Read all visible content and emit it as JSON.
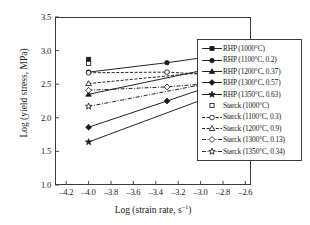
{
  "chart_data": {
    "type": "line",
    "title": "",
    "xlabel": "Log (strain rate, s⁻¹)",
    "ylabel": "Log (yield stress, MPa)",
    "xlim": [
      -4.3,
      -2.55
    ],
    "ylim": [
      1.0,
      3.5
    ],
    "xticks": [
      -4.2,
      -4.0,
      -3.8,
      -3.6,
      -3.4,
      -3.2,
      -3.0,
      -2.8,
      -2.6
    ],
    "xtick_labels": [
      "–4.2",
      "–4.0",
      "–3.8",
      "–3.6",
      "–3.4",
      "–3.2",
      "–3.0",
      "–2.8",
      "–2.6"
    ],
    "yticks": [
      1.0,
      1.5,
      2.0,
      2.5,
      3.0,
      3.5
    ],
    "ytick_labels": [
      "1.0",
      "1.5",
      "2.0",
      "2.5",
      "3.0",
      "3.5"
    ],
    "grid": false,
    "legend_position": "right",
    "series": [
      {
        "name": "RHP (1000°C)",
        "marker": "filled-square",
        "line": "solid",
        "x": [
          -4.0
        ],
        "y": [
          2.87
        ]
      },
      {
        "name": "RHP (1100°C, 0.2)",
        "marker": "filled-circle",
        "line": "solid",
        "x": [
          -4.0,
          -3.3,
          -3.0
        ],
        "y": [
          2.68,
          2.82,
          2.89
        ]
      },
      {
        "name": "RHP (1200°C, 0.37)",
        "marker": "filled-triangle",
        "line": "solid",
        "x": [
          -4.0,
          -3.0
        ],
        "y": [
          2.35,
          2.7
        ]
      },
      {
        "name": "RHP (1300°C, 0.57)",
        "marker": "filled-diamond",
        "line": "solid",
        "x": [
          -4.0,
          -3.3,
          -3.0
        ],
        "y": [
          1.86,
          2.25,
          2.42
        ]
      },
      {
        "name": "RHP (1350°C, 0.63)",
        "marker": "filled-star",
        "line": "solid",
        "x": [
          -4.0,
          -3.0
        ],
        "y": [
          1.64,
          2.26
        ]
      },
      {
        "name": "Starck (1000°C)",
        "marker": "open-square",
        "line": "none",
        "x": [
          -4.0
        ],
        "y": [
          2.81
        ]
      },
      {
        "name": "Starck (1100°C, 0.3)",
        "marker": "open-circle",
        "line": "dashed",
        "x": [
          -4.0,
          -3.3,
          -3.0
        ],
        "y": [
          2.67,
          2.68,
          2.65
        ]
      },
      {
        "name": "Starck (1200°C, 0.9)",
        "marker": "open-triangle",
        "line": "dashed",
        "x": [
          -4.0,
          -3.0
        ],
        "y": [
          2.51,
          2.67
        ]
      },
      {
        "name": "Starck (1300°C, 0.13)",
        "marker": "open-diamond",
        "line": "dashdot",
        "x": [
          -4.0,
          -3.3,
          -3.0
        ],
        "y": [
          2.41,
          2.46,
          2.5
        ]
      },
      {
        "name": "Starck (1350°C, 0.34)",
        "marker": "open-star",
        "line": "dashdot",
        "x": [
          -4.0,
          -3.0
        ],
        "y": [
          2.17,
          2.49
        ]
      }
    ]
  },
  "legend": {
    "entries": [
      {
        "label": "RHP (1000°C)"
      },
      {
        "label": "RHP (1100°C, 0.2)"
      },
      {
        "label": "RHP (1200°C, 0.37)"
      },
      {
        "label": "RHP (1300°C, 0.57)"
      },
      {
        "label": "RHP (1350°C, 0.63)"
      },
      {
        "label": "Starck (1000°C)"
      },
      {
        "label": "Starck (1100°C, 0.3)"
      },
      {
        "label": "Starck (1200°C, 0.9)"
      },
      {
        "label": "Starck (1300°C, 0.13)"
      },
      {
        "label": "Starck (1350°C, 0.34)"
      }
    ]
  },
  "colors": {
    "ink": "#1a1a1a",
    "axis": "#3a3a3a",
    "background": "#ffffff"
  }
}
